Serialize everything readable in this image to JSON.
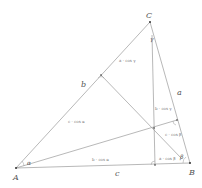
{
  "diagram": {
    "vertices": {
      "A": {
        "label": "A",
        "x": 16,
        "y": 168
      },
      "B": {
        "label": "B",
        "x": 190,
        "y": 163
      },
      "C": {
        "label": "C",
        "x": 150,
        "y": 22
      }
    },
    "feet": {
      "on_AB": {
        "x": 155,
        "y": 165
      },
      "on_AC": {
        "x": 101,
        "y": 75
      },
      "on_BC": {
        "x": 177,
        "y": 120
      }
    },
    "orthocenter": {
      "x": 154,
      "y": 128
    },
    "side_labels": {
      "a": "a",
      "b": "b",
      "c": "c"
    },
    "angle_labels": {
      "alpha": "α",
      "beta": "β",
      "gamma": "γ"
    },
    "segment_labels": {
      "a_cos_gamma": "a · cos γ",
      "b_cos_gamma": "b · cos γ",
      "c_cos_alpha": "c · cos α",
      "b_cos_alpha": "b · cos α",
      "c_cos_beta": "c · cos β",
      "a_cos_beta": "a · cos β"
    },
    "colors": {
      "line": "#999999",
      "text": "#555555",
      "point": "#333333"
    }
  }
}
